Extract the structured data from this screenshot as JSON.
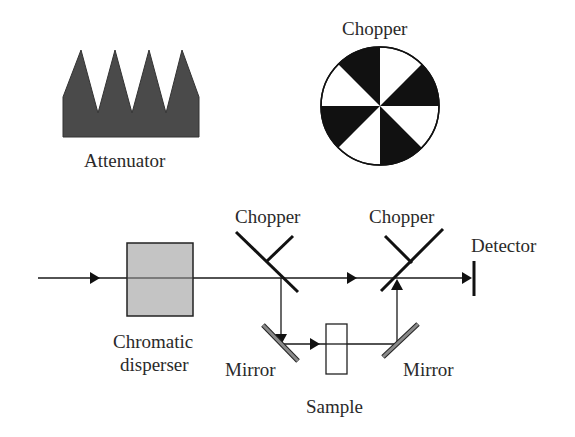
{
  "diagram": {
    "labels": {
      "attenuator": "Attenuator",
      "chopper_wheel": "Chopper",
      "chopper_left": "Chopper",
      "chopper_right": "Chopper",
      "detector": "Detector",
      "disperser_line1": "Chromatic",
      "disperser_line2": "disperser",
      "mirror_left": "Mirror",
      "mirror_right": "Mirror",
      "sample": "Sample"
    },
    "icons": {
      "attenuator": "sawtooth-attenuator-icon",
      "chopper_wheel": "sectored-chopper-wheel-icon",
      "disperser": "gray-box-disperser-icon",
      "detector": "bar-detector-icon"
    },
    "colors": {
      "line": "#1a1a1a",
      "attenuator_fill": "#4a4a4a",
      "disperser_fill": "#c4c4c4",
      "mirror_fill": "#8a8a8a",
      "background": "#ffffff"
    },
    "nodes": [
      "Attenuator",
      "Chopper wheel",
      "Chromatic disperser",
      "Chopper (beam splitter)",
      "Mirror",
      "Sample",
      "Mirror",
      "Chopper (beam combiner)",
      "Detector"
    ],
    "edges": [
      {
        "from": "source",
        "to": "Chromatic disperser"
      },
      {
        "from": "Chromatic disperser",
        "to": "Chopper (beam splitter)"
      },
      {
        "from": "Chopper (beam splitter)",
        "to": "Chopper (beam combiner)",
        "path": "reference"
      },
      {
        "from": "Chopper (beam splitter)",
        "to": "Mirror"
      },
      {
        "from": "Mirror",
        "to": "Sample"
      },
      {
        "from": "Sample",
        "to": "Mirror"
      },
      {
        "from": "Mirror",
        "to": "Chopper (beam combiner)"
      },
      {
        "from": "Chopper (beam combiner)",
        "to": "Detector"
      }
    ]
  }
}
